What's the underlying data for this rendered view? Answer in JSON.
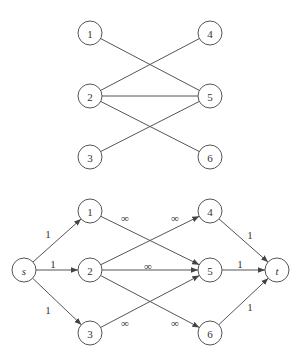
{
  "top_graph": {
    "nodes": [
      {
        "id": "1",
        "label": "1",
        "x": 90,
        "y": 33
      },
      {
        "id": "2",
        "label": "2",
        "x": 90,
        "y": 96
      },
      {
        "id": "3",
        "label": "3",
        "x": 90,
        "y": 157
      },
      {
        "id": "4",
        "label": "4",
        "x": 210,
        "y": 33
      },
      {
        "id": "5",
        "label": "5",
        "x": 210,
        "y": 96
      },
      {
        "id": "6",
        "label": "6",
        "x": 210,
        "y": 157
      }
    ],
    "edges": [
      {
        "from": "1",
        "to": "5"
      },
      {
        "from": "2",
        "to": "4"
      },
      {
        "from": "2",
        "to": "5"
      },
      {
        "from": "2",
        "to": "6"
      },
      {
        "from": "3",
        "to": "5"
      }
    ]
  },
  "bottom_graph": {
    "nodes": [
      {
        "id": "s",
        "label": "s",
        "x": 24,
        "y": 270,
        "italic": true
      },
      {
        "id": "1",
        "label": "1",
        "x": 90,
        "y": 211
      },
      {
        "id": "2",
        "label": "2",
        "x": 90,
        "y": 270
      },
      {
        "id": "3",
        "label": "3",
        "x": 90,
        "y": 333
      },
      {
        "id": "4",
        "label": "4",
        "x": 210,
        "y": 211
      },
      {
        "id": "5",
        "label": "5",
        "x": 210,
        "y": 270
      },
      {
        "id": "6",
        "label": "6",
        "x": 210,
        "y": 333
      },
      {
        "id": "t",
        "label": "t",
        "x": 277,
        "y": 270,
        "italic": true
      }
    ],
    "edges": [
      {
        "from": "s",
        "to": "1",
        "label": "1",
        "lx": 48,
        "ly": 238
      },
      {
        "from": "s",
        "to": "2",
        "label": "1",
        "lx": 53,
        "ly": 268
      },
      {
        "from": "s",
        "to": "3",
        "label": "1",
        "lx": 48,
        "ly": 314
      },
      {
        "from": "1",
        "to": "5",
        "label": "∞",
        "lx": 125,
        "ly": 222
      },
      {
        "from": "2",
        "to": "4",
        "label": "∞",
        "lx": 175,
        "ly": 222
      },
      {
        "from": "2",
        "to": "5",
        "label": "∞",
        "lx": 148,
        "ly": 270
      },
      {
        "from": "2",
        "to": "6",
        "label": "∞",
        "lx": 175,
        "ly": 327
      },
      {
        "from": "3",
        "to": "5",
        "label": "∞",
        "lx": 125,
        "ly": 327
      },
      {
        "from": "4",
        "to": "t",
        "label": "1",
        "lx": 250,
        "ly": 239
      },
      {
        "from": "5",
        "to": "t",
        "label": "1",
        "lx": 240,
        "ly": 268
      },
      {
        "from": "6",
        "to": "t",
        "label": "1",
        "lx": 250,
        "ly": 311
      }
    ]
  }
}
